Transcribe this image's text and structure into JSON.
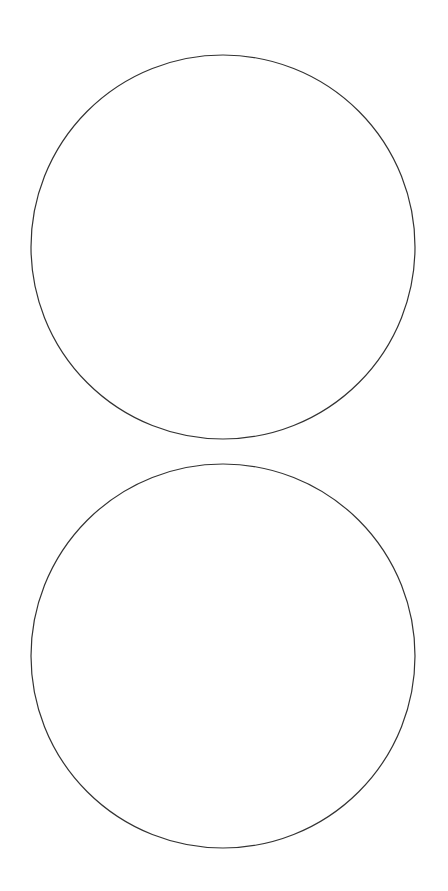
{
  "canvas": {
    "width": 448,
    "height": 891,
    "background": "#ffffff"
  },
  "shapes": [
    {
      "type": "circle",
      "name": "top-circle",
      "cx": 223,
      "cy": 247,
      "r": 192,
      "stroke": "#333333",
      "stroke_width": 1.2,
      "fill": "none"
    },
    {
      "type": "circle",
      "name": "bottom-circle",
      "cx": 223,
      "cy": 656,
      "r": 192,
      "stroke": "#333333",
      "stroke_width": 1.2,
      "fill": "none"
    }
  ],
  "overlay_text": {
    "line_1": "",
    "line_2": "",
    "color": "#ffffff"
  }
}
